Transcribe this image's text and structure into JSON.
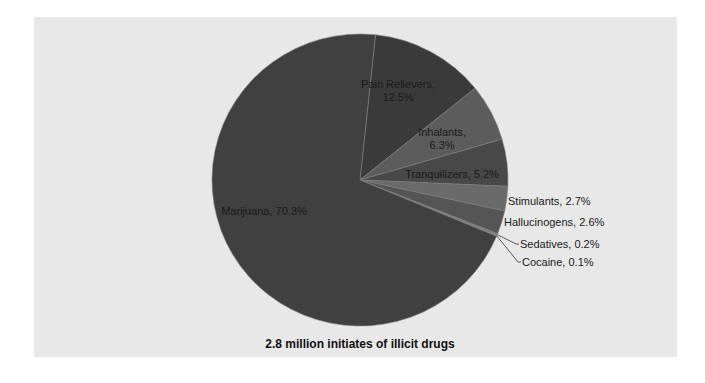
{
  "chart_data": {
    "type": "pie",
    "title": "2.8 million initiates of illicit drugs",
    "categories": [
      "Pain Relievers",
      "Inhalants",
      "Tranquilizers",
      "Stimulants",
      "Hallucinogens",
      "Sedatives",
      "Cocaine",
      "Marijuana"
    ],
    "values": [
      12.5,
      6.3,
      5.2,
      2.7,
      2.6,
      0.2,
      0.1,
      70.3
    ],
    "unit": "%",
    "labels": [
      "Pain Relievers, 12.5%",
      "Inhalants, 6.3%",
      "Tranquilizers, 5.2%",
      "Stimulants, 2.7%",
      "Hallucinogens, 2.6%",
      "Sedatives, 0.2%",
      "Cocaine, 0.1%",
      "Marijuana, 70.3%"
    ],
    "colors": [
      "#3a3a3a",
      "#5c5c5c",
      "#484848",
      "#6a6a6a",
      "#555555",
      "#7a7a7a",
      "#8a8a8a",
      "#404040"
    ],
    "legend": "none (data labels on slices)"
  },
  "title": "2.8 million initiates of illicit drugs"
}
